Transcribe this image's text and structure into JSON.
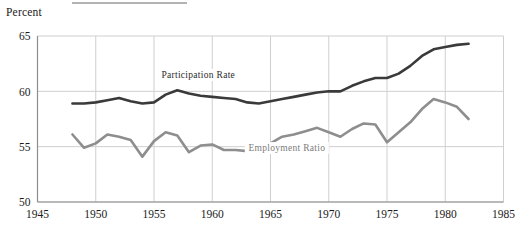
{
  "figure": {
    "top_rule_visible": true,
    "y_axis_title": "Percent"
  },
  "chart_data": {
    "type": "line",
    "title": "",
    "subtitle": "",
    "xlabel": "",
    "ylabel": "Percent",
    "xlim": [
      1945,
      1985
    ],
    "ylim": [
      50,
      65
    ],
    "xticks": [
      1945,
      1950,
      1955,
      1960,
      1965,
      1970,
      1975,
      1980,
      1985
    ],
    "xtick_labels": [
      "1945",
      "1950",
      "1955",
      "1960",
      "1965",
      "1970",
      "1975",
      "1980",
      "1985"
    ],
    "yticks": [
      50,
      55,
      60,
      65
    ],
    "ytick_labels": [
      "50",
      "55",
      "60",
      "65"
    ],
    "grid": true,
    "grid_color": "#cfcfcf",
    "legend": "inline-annotations",
    "background": "#ffffff",
    "series": [
      {
        "name": "Participation Rate",
        "color": "#3a3a3a",
        "line_width": 2.6,
        "label_position": {
          "x": 1958.8,
          "y": 61.2
        },
        "x": [
          1948,
          1949,
          1950,
          1951,
          1952,
          1953,
          1954,
          1955,
          1956,
          1957,
          1958,
          1959,
          1960,
          1961,
          1962,
          1963,
          1964,
          1965,
          1966,
          1967,
          1968,
          1969,
          1970,
          1971,
          1972,
          1973,
          1974,
          1975,
          1976,
          1977,
          1978,
          1979,
          1980,
          1981,
          1982
        ],
        "values": [
          58.9,
          58.9,
          59.0,
          59.2,
          59.4,
          59.1,
          58.9,
          59.0,
          59.7,
          60.1,
          59.8,
          59.6,
          59.5,
          59.4,
          59.3,
          59.0,
          58.9,
          59.1,
          59.3,
          59.5,
          59.7,
          59.9,
          60.0,
          60.0,
          60.5,
          60.9,
          61.2,
          61.2,
          61.6,
          62.3,
          63.2,
          63.8,
          64.0,
          64.2,
          64.3
        ]
      },
      {
        "name": "Employment Ratio",
        "color": "#8e8e8e",
        "line_width": 2.6,
        "label_position": {
          "x": 1966.4,
          "y": 54.6
        },
        "x": [
          1948,
          1949,
          1950,
          1951,
          1952,
          1953,
          1954,
          1955,
          1956,
          1957,
          1958,
          1959,
          1960,
          1961,
          1962,
          1963,
          1964,
          1965,
          1966,
          1967,
          1968,
          1969,
          1970,
          1971,
          1972,
          1973,
          1974,
          1975,
          1976,
          1977,
          1978,
          1979,
          1980,
          1981,
          1982
        ],
        "values": [
          56.1,
          54.9,
          55.3,
          56.1,
          55.9,
          55.6,
          54.1,
          55.5,
          56.3,
          56.0,
          54.5,
          55.1,
          55.2,
          54.7,
          54.7,
          54.6,
          54.8,
          55.3,
          55.9,
          56.1,
          56.4,
          56.7,
          56.3,
          55.9,
          56.6,
          57.1,
          57.0,
          55.4,
          56.3,
          57.2,
          58.4,
          59.3,
          59.0,
          58.6,
          57.5
        ]
      }
    ]
  }
}
